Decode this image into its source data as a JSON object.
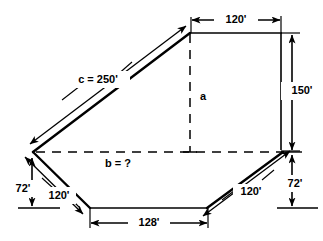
{
  "figure": {
    "type": "geometry-diagram",
    "background_color": "#ffffff",
    "line_color": "#000000",
    "labels": {
      "top_width": "120'",
      "right_height": "150'",
      "hypotenuse": "c = 250'",
      "vertical_leg": "a",
      "horizontal_leg": "b = ?",
      "left_drop": "72'",
      "left_slope": "120'",
      "bottom_width": "128'",
      "right_slope": "120'",
      "right_drop": "72'"
    },
    "measurements": [
      {
        "name": "top-width",
        "value": 120,
        "unit": "ft",
        "text": "120'"
      },
      {
        "name": "right-height",
        "value": 150,
        "unit": "ft",
        "text": "150'"
      },
      {
        "name": "hypotenuse-c",
        "value": 250,
        "unit": "ft",
        "text": "c = 250'"
      },
      {
        "name": "vertical-leg-a",
        "value": null,
        "unit": "ft",
        "text": "a"
      },
      {
        "name": "horizontal-leg-b",
        "value": null,
        "unit": "ft",
        "text": "b = ?"
      },
      {
        "name": "left-drop",
        "value": 72,
        "unit": "ft",
        "text": "72'"
      },
      {
        "name": "left-slope",
        "value": 120,
        "unit": "ft",
        "text": "120'"
      },
      {
        "name": "bottom-width",
        "value": 128,
        "unit": "ft",
        "text": "128'"
      },
      {
        "name": "right-slope",
        "value": 120,
        "unit": "ft",
        "text": "120'"
      },
      {
        "name": "right-drop",
        "value": 72,
        "unit": "ft",
        "text": "72'"
      }
    ]
  }
}
